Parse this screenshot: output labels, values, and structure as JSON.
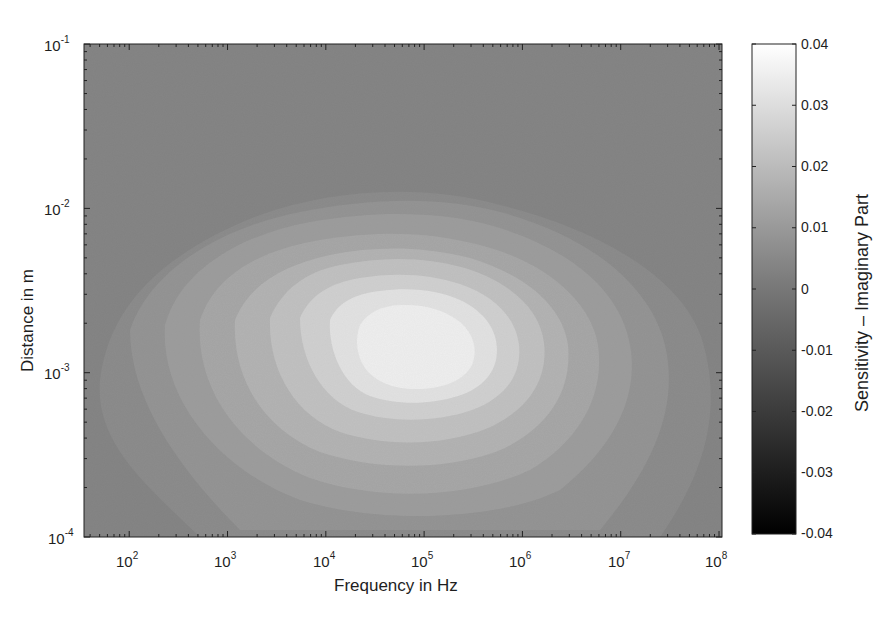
{
  "chart_data": {
    "type": "heatmap",
    "subtype": "filled-contour",
    "title": "",
    "xlabel": "Frequency in Hz",
    "ylabel": "Distance in m",
    "xscale": "log",
    "yscale": "log",
    "xlim": [
      35,
      100000000
    ],
    "ylim": [
      0.0001,
      0.1
    ],
    "x_ticks": [
      {
        "base": "10",
        "exp": "2",
        "value": 100
      },
      {
        "base": "10",
        "exp": "3",
        "value": 1000
      },
      {
        "base": "10",
        "exp": "4",
        "value": 10000
      },
      {
        "base": "10",
        "exp": "5",
        "value": 100000
      },
      {
        "base": "10",
        "exp": "6",
        "value": 1000000
      },
      {
        "base": "10",
        "exp": "7",
        "value": 10000000
      },
      {
        "base": "10",
        "exp": "8",
        "value": 100000000
      }
    ],
    "y_ticks": [
      {
        "base": "10",
        "exp": "-1",
        "value": 0.1
      },
      {
        "base": "10",
        "exp": "-2",
        "value": 0.01
      },
      {
        "base": "10",
        "exp": "-3",
        "value": 0.001
      },
      {
        "base": "10",
        "exp": "-4",
        "value": 0.0001
      }
    ],
    "colorbar": {
      "label": "Sensitivity – Imaginary Part",
      "range": [
        -0.04,
        0.04
      ],
      "ticks": [
        "0.04",
        "0.03",
        "0.02",
        "0.01",
        "0",
        "-0.01",
        "-0.02",
        "-0.03",
        "-0.04"
      ],
      "colormap": "gray",
      "color_low": "#000000",
      "color_high": "#ffffff"
    },
    "background_value": 0.005,
    "peak": {
      "frequency_hz": 80000,
      "distance_m": 0.0015,
      "value": 0.038
    },
    "contour_levels": [
      0.008,
      0.012,
      0.016,
      0.02,
      0.024,
      0.028,
      0.032,
      0.036
    ],
    "grid": false,
    "legend": null
  },
  "render": {
    "plot": {
      "x0": 84,
      "y0": 44,
      "x1": 722,
      "y1": 537
    },
    "decade_px_x": 98.3,
    "x_origin_exp": 1.54,
    "decade_px_y": 164.3,
    "colorbar": {
      "x0": 752,
      "y0": 44,
      "x1": 796,
      "y1": 534
    },
    "bands": [
      {
        "level": 0.008,
        "fill": "#8c8c8c",
        "d": "M100,380 C110,300 170,250 260,215 C330,190 420,183 500,205 C600,230 690,280 705,350 C722,420 700,480 660,537 L200,537 C140,480 95,440 100,380 Z"
      },
      {
        "level": 0.012,
        "fill": "#949494",
        "d": "M130,330 C150,270 220,228 300,212 C370,198 440,196 500,212 C590,236 650,285 665,345 C680,410 650,470 600,530 L240,530 C180,470 130,400 130,330 Z"
      },
      {
        "level": 0.016,
        "fill": "#9d9d9d",
        "d": "M165,325 C180,270 240,235 310,222 C380,210 440,212 490,225 C570,248 620,290 630,345 C640,400 610,450 560,490 C500,520 380,525 300,500 C220,470 160,400 165,325 Z"
      },
      {
        "level": 0.02,
        "fill": "#a7a7a7",
        "d": "M200,320 C215,275 260,250 320,240 C380,230 430,232 480,245 C545,262 590,300 598,345 C605,395 580,440 530,470 C470,498 380,502 310,478 C240,450 195,390 200,320 Z"
      },
      {
        "level": 0.024,
        "fill": "#b3b3b3",
        "d": "M235,320 C250,283 285,265 330,255 C380,245 425,247 470,258 C525,275 562,305 568,345 C572,390 550,425 505,448 C455,470 380,472 320,452 C265,430 232,380 235,320 Z"
      },
      {
        "level": 0.028,
        "fill": "#c1c1c1",
        "d": "M270,318 C282,290 305,272 340,265 C385,256 425,257 465,268 C512,283 540,310 544,343 C548,380 528,410 488,428 C445,446 385,447 340,432 C295,415 268,370 270,318 Z"
      },
      {
        "level": 0.032,
        "fill": "#d0d0d0",
        "d": "M300,318 C310,295 330,283 360,278 C395,272 430,274 460,284 C495,296 516,318 519,345 C522,375 505,398 472,410 C438,422 392,423 358,412 C322,400 300,360 300,318 Z"
      },
      {
        "level": 0.036,
        "fill": "#e2e2e2",
        "d": "M330,320 C338,302 355,294 380,291 C410,287 438,290 460,300 C485,312 497,330 497,350 C497,372 483,388 458,396 C430,405 395,405 370,396 C343,386 328,350 330,320 Z"
      },
      {
        "level": 0.039,
        "fill": "#eeeeee",
        "d": "M360,325 C368,312 382,306 400,305 C425,304 445,310 460,322 C474,334 478,350 472,365 C464,380 445,388 420,389 C395,390 375,382 365,368 C356,355 355,338 360,325 Z"
      }
    ]
  }
}
